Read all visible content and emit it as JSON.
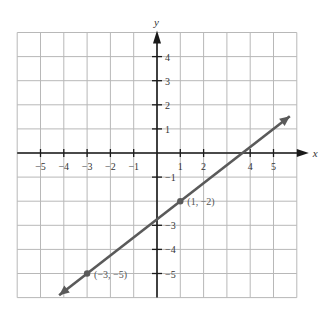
{
  "chart_data": {
    "type": "line",
    "title": "",
    "xlabel": "x",
    "ylabel": "y",
    "xlim": [
      -6,
      6
    ],
    "ylim": [
      -6,
      5
    ],
    "grid": true,
    "x_ticks": [
      -5,
      -4,
      -3,
      -2,
      -1,
      1,
      2,
      4,
      5
    ],
    "x_tick_labels": [
      "−5",
      "−4",
      "−3",
      "−2",
      "−1",
      "1",
      "2",
      "4",
      "5"
    ],
    "y_ticks": [
      4,
      3,
      2,
      1,
      -1,
      -3,
      -4,
      -5
    ],
    "y_tick_labels": [
      "4",
      "3",
      "2",
      "1",
      "−1",
      "−3",
      "−4",
      "−5"
    ],
    "series": [
      {
        "name": "line through (1, -2) and (-3, -5)",
        "slope": 0.75,
        "intercept": -2.75,
        "x": [
          -4.2,
          5.7
        ],
        "y": [
          -5.9,
          1.525
        ],
        "color": "#5a5a5a",
        "arrows": "both"
      }
    ],
    "points": [
      {
        "x": 1,
        "y": -2,
        "label": "(1, −2)"
      },
      {
        "x": -3,
        "y": -5,
        "label": "(−3, −5)"
      }
    ],
    "annotations": [
      "(1, −2)",
      "(−3, −5)"
    ]
  },
  "axes": {
    "x_label": "x",
    "y_label": "y"
  },
  "colors": {
    "grid": "#b8b8b8",
    "axis": "#1a1a1a",
    "line": "#5a5a5a",
    "background": "#ffffff"
  }
}
